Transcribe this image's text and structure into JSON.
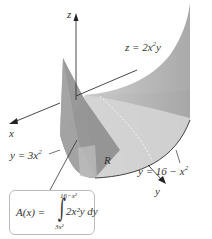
{
  "figure": {
    "axes": {
      "z_label": "z",
      "x_label": "x",
      "y_label": "y"
    },
    "labels": {
      "surface": "z = 2x²y",
      "surface_eq_left": "z = 2x",
      "surface_eq_sup": "2",
      "surface_eq_right": "y",
      "lower_curve_left": "y = 3x",
      "lower_curve_sup": "2",
      "upper_curve_left": "y = 16 − x",
      "upper_curve_sup": "2",
      "region": "R"
    },
    "formula": {
      "lhs": "A(x) = ",
      "upper_limit": "16−x²",
      "lower_limit": "3x²",
      "integrand": "2x²y dy",
      "integral_symbol": "∫"
    },
    "colors": {
      "surface_dark": "#8a8a8a",
      "surface_mid": "#b0b0b0",
      "surface_light": "#d4d4d4",
      "region_fill": "#e6e6e6",
      "axis": "#333333",
      "box_border": "#bbbbbb"
    }
  }
}
